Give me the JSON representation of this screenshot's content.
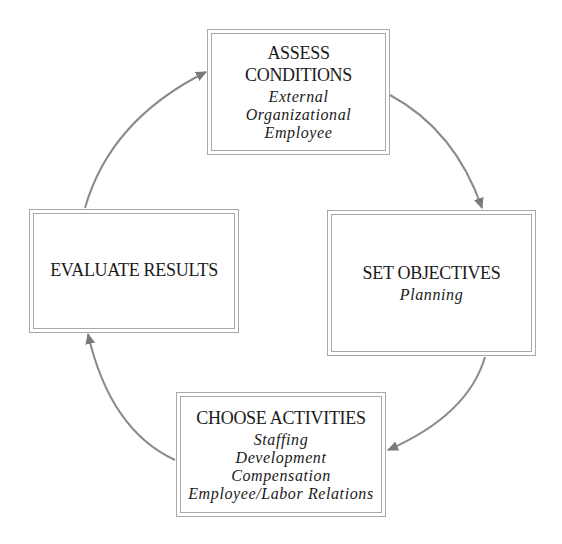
{
  "diagram": {
    "type": "cycle",
    "colors": {
      "border": "#a8a8a8",
      "arrow": "#7a7a7a",
      "text": "#1a1a1a"
    },
    "nodes": [
      {
        "id": "assess",
        "title": "ASSESS CONDITIONS",
        "items": [
          "External",
          "Organizational",
          "Employee"
        ]
      },
      {
        "id": "set",
        "title": "SET OBJECTIVES",
        "items": [
          "Planning"
        ]
      },
      {
        "id": "choose",
        "title": "CHOOSE ACTIVITIES",
        "items": [
          "Staffing",
          "Development",
          "Compensation",
          "Employee/Labor Relations"
        ]
      },
      {
        "id": "evaluate",
        "title": "EVALUATE RESULTS",
        "items": []
      }
    ],
    "edges": [
      {
        "from": "assess",
        "to": "set"
      },
      {
        "from": "set",
        "to": "choose"
      },
      {
        "from": "choose",
        "to": "evaluate"
      },
      {
        "from": "evaluate",
        "to": "assess"
      }
    ]
  }
}
